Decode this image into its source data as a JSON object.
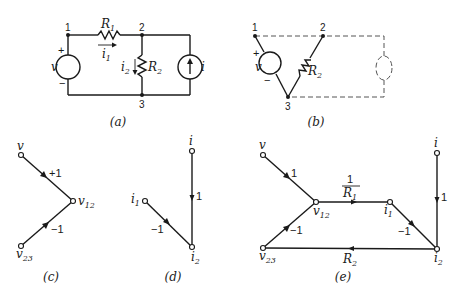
{
  "figure": {
    "panels": [
      {
        "id": "a",
        "caption": "(a)",
        "type": "circuit",
        "nodes": {
          "n1": "1",
          "n2": "2",
          "n3": "3"
        },
        "elements": {
          "R1": {
            "name": "R",
            "sub": "1"
          },
          "R2": {
            "name": "R",
            "sub": "2"
          },
          "i1": {
            "name": "i",
            "sub": "1"
          },
          "i2": {
            "name": "i",
            "sub": "2"
          },
          "v": "v",
          "i": "i",
          "plus": "+",
          "minus": "−"
        }
      },
      {
        "id": "b",
        "caption": "(b)",
        "type": "circuit-tree",
        "nodes": {
          "n1": "1",
          "n2": "2",
          "n3": "3"
        },
        "elements": {
          "R2": {
            "name": "R",
            "sub": "2"
          },
          "v": "v",
          "plus": "+",
          "minus": "−"
        }
      },
      {
        "id": "c",
        "caption": "(c)",
        "type": "signal-flow-graph",
        "nodes": {
          "v": "v",
          "v12": {
            "name": "v",
            "sub": "12"
          },
          "v23": {
            "name": "v",
            "sub": "23"
          }
        },
        "branches": [
          {
            "from": "v",
            "to": "v12",
            "gain": "+1"
          },
          {
            "from": "v23",
            "to": "v12",
            "gain": "−1"
          }
        ]
      },
      {
        "id": "d",
        "caption": "(d)",
        "type": "signal-flow-graph",
        "nodes": {
          "i": "i",
          "i1": {
            "name": "i",
            "sub": "1"
          },
          "i2": {
            "name": "i",
            "sub": "2"
          }
        },
        "branches": [
          {
            "from": "i",
            "to": "i2",
            "gain": "1"
          },
          {
            "from": "i1",
            "to": "i2",
            "gain": "−1"
          }
        ]
      },
      {
        "id": "e",
        "caption": "(e)",
        "type": "signal-flow-graph",
        "nodes": {
          "v": "v",
          "v12": {
            "name": "v",
            "sub": "12"
          },
          "v23": {
            "name": "v",
            "sub": "23"
          },
          "i1": {
            "name": "i",
            "sub": "1"
          },
          "i2": {
            "name": "i",
            "sub": "2"
          },
          "i": "i"
        },
        "branches": [
          {
            "from": "v",
            "to": "v12",
            "gain": "1"
          },
          {
            "from": "v23",
            "to": "v12",
            "gain": "−1"
          },
          {
            "from": "v12",
            "to": "i1",
            "gain_num": "1",
            "gain_den": {
              "name": "R",
              "sub": "1"
            }
          },
          {
            "from": "i1",
            "to": "i2",
            "gain": "−1"
          },
          {
            "from": "i",
            "to": "i2",
            "gain": "1"
          },
          {
            "from": "i2",
            "to": "v23",
            "gain": {
              "name": "R",
              "sub": "2"
            }
          }
        ]
      }
    ]
  }
}
